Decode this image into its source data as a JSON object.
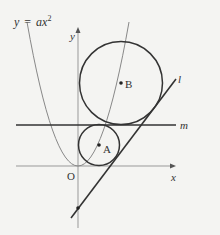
{
  "diagram": {
    "curve_label": {
      "y": "y",
      "eq": "=",
      "a": "a",
      "x": "x",
      "exp": "2"
    },
    "axes": {
      "x_label": "x",
      "y_label": "y",
      "origin_label": "O"
    },
    "points": {
      "A": "A",
      "B": "B"
    },
    "lines": {
      "l": "l",
      "m": "m"
    },
    "colors": {
      "background": "#f4f4f2",
      "axis": "#888888",
      "stroke": "#333333",
      "parabola": "#777777"
    }
  }
}
